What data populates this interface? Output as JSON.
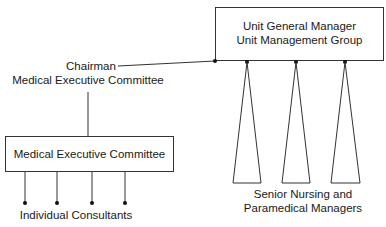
{
  "diagram": {
    "ugm_box": {
      "line1": "Unit General Manager",
      "line2": "Unit Management Group"
    },
    "chairman_label": {
      "line1": "Chairman",
      "line2": "Medical Executive Committee"
    },
    "mec_box": {
      "label": "Medical Executive Committee"
    },
    "consultants_label": "Individual Consultants",
    "managers_label": {
      "line1": "Senior Nursing and",
      "line2": "Paramedical Managers"
    },
    "colors": {
      "line": "#333333",
      "background": "#ffffff"
    }
  }
}
